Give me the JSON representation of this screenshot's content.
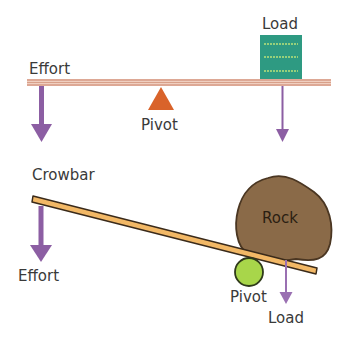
{
  "diagram": {
    "seesaw": {
      "labels": {
        "effort": "Effort",
        "pivot": "Pivot",
        "load": "Load"
      }
    },
    "crowbar": {
      "labels": {
        "crowbar": "Crowbar",
        "effort": "Effort",
        "rock": "Rock",
        "pivot": "Pivot",
        "load": "Load"
      }
    },
    "colors": {
      "beam": "#e8b8a4",
      "beam_stripe": "#c9826a",
      "pivot_triangle": "#d9632a",
      "load_box": "#2e9a82",
      "load_box_lines": "#b9e27a",
      "arrow": "#8c5ea3",
      "crowbar": "#f2b866",
      "rock": "#8a6a48",
      "pivot_circle": "#a8d64a"
    }
  }
}
